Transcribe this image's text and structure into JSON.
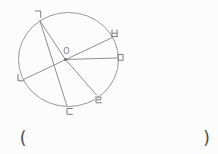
{
  "figure": {
    "type": "circle-geometry-diagram",
    "center_label": "O",
    "point_labels": [
      {
        "name": "giyeok",
        "char": "ㄱ",
        "position": "top-left"
      },
      {
        "name": "nieun",
        "char": "ㄴ",
        "position": "left"
      },
      {
        "name": "digeut",
        "char": "ㄷ",
        "position": "bottom"
      },
      {
        "name": "rieul",
        "char": "ㄹ",
        "position": "bottom-right"
      },
      {
        "name": "mieum",
        "char": "ㅁ",
        "position": "right"
      },
      {
        "name": "bieup",
        "char": "ㅂ",
        "position": "upper-right"
      }
    ],
    "segments": [
      {
        "from": "ㄱ",
        "to": "ㄷ",
        "through_center": false
      },
      {
        "from": "ㄱ",
        "to": "ㄹ",
        "through_center": true
      },
      {
        "from": "ㄴ",
        "to": "ㅂ",
        "through_center": true
      },
      {
        "from": "O",
        "to": "ㅁ",
        "through_center": true
      }
    ],
    "colors": {
      "line": "#8f8f8f",
      "circle": "#9a9a9a",
      "label": "#7d7d7d",
      "bracket": "#4a4a4a",
      "background": "#fcfcfc"
    }
  },
  "answer": {
    "open_bracket": "(",
    "close_bracket": ")"
  }
}
